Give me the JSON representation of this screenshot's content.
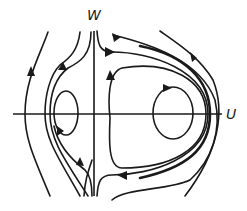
{
  "diagram": {
    "type": "phase-portrait",
    "axes": {
      "horizontal_label": "U",
      "vertical_label": "W"
    },
    "colors": {
      "stroke": "#1a1a1a",
      "background": "#ffffff"
    },
    "elements": [
      {
        "name": "left-center-orbit",
        "kind": "closed-orbit",
        "direction": "counterclockwise-arrow-bottom"
      },
      {
        "name": "right-center-orbit",
        "kind": "closed-orbit",
        "direction": "arrow-top-pointing-right"
      },
      {
        "name": "right-separatrix-loop",
        "kind": "homoclinic-loop"
      },
      {
        "name": "outer-left-streamline",
        "kind": "open-trajectory",
        "direction": "upward"
      },
      {
        "name": "left-inner-streamlines",
        "kind": "open-trajectory",
        "direction": "upward"
      },
      {
        "name": "outer-right-streamlines",
        "kind": "open-trajectory",
        "direction": "downward-right"
      }
    ]
  }
}
